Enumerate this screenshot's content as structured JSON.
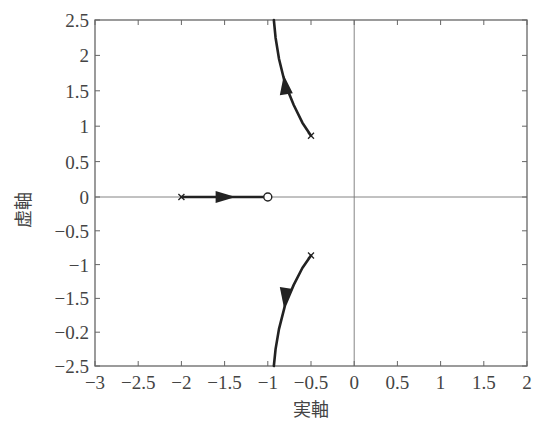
{
  "chart_data": {
    "type": "line",
    "subtype": "root-locus",
    "title": "",
    "xlabel": "実軸",
    "ylabel": "虚軸",
    "xlim": [
      -3,
      2
    ],
    "ylim": [
      -2.5,
      2.5
    ],
    "grid": false,
    "legend": null,
    "x_ticks": [
      -3,
      -2.5,
      -2,
      -1.5,
      -1,
      -0.5,
      0,
      0.5,
      1,
      1.5,
      2
    ],
    "x_tick_labels": [
      "−3",
      "−2.5",
      "−2",
      "−1.5",
      "−1",
      "−0.5",
      "0",
      "0.5",
      "1",
      "1.5",
      "2"
    ],
    "y_ticks": [
      2.5,
      2,
      1.5,
      1,
      0.5,
      0,
      -0.5,
      -1,
      -1.5,
      -2,
      -2.5
    ],
    "y_tick_labels": [
      "2.5",
      "2",
      "1.5",
      "1",
      "0.5",
      "0",
      "−0.5",
      "−1",
      "−1.5",
      "−0.2",
      "−2.5"
    ],
    "reference_lines": [
      {
        "axis": "x",
        "value": 0
      },
      {
        "axis": "y",
        "value": 0
      }
    ],
    "poles": [
      {
        "re": -0.5,
        "im": 0.866
      },
      {
        "re": -0.5,
        "im": -0.866
      },
      {
        "re": -2.0,
        "im": 0
      }
    ],
    "zeros": [
      {
        "re": -1.0,
        "im": 0
      }
    ],
    "series": [
      {
        "name": "upper-branch",
        "direction": "from pole toward top",
        "x": [
          -0.5,
          -0.6,
          -0.7,
          -0.8,
          -0.87,
          -0.91,
          -0.93
        ],
        "y": [
          0.866,
          1.05,
          1.3,
          1.6,
          1.95,
          2.25,
          2.5
        ]
      },
      {
        "name": "lower-branch",
        "direction": "from pole toward bottom",
        "x": [
          -0.5,
          -0.6,
          -0.7,
          -0.8,
          -0.87,
          -0.91,
          -0.93
        ],
        "y": [
          -0.866,
          -1.05,
          -1.3,
          -1.6,
          -1.95,
          -2.25,
          -2.5
        ]
      },
      {
        "name": "real-axis-branch",
        "direction": "from pole -2 to zero -1",
        "x": [
          -2.0,
          -1.0
        ],
        "y": [
          0,
          0
        ]
      }
    ],
    "arrows": [
      {
        "re": -0.78,
        "im": 1.55,
        "dir": "up"
      },
      {
        "re": -0.78,
        "im": -1.45,
        "dir": "down"
      },
      {
        "re": -1.5,
        "im": 0,
        "dir": "right"
      }
    ]
  },
  "colors": {
    "frame": "#555555",
    "locus": "#222222",
    "text": "#444444"
  }
}
